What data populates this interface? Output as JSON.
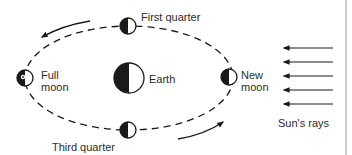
{
  "diagram": {
    "labels": {
      "first_quarter": "First quarter",
      "full_moon": "Full\nmoon",
      "earth": "Earth",
      "new_moon": "New\nmoon",
      "third_quarter": "Third quarter",
      "sun_rays": "Sun's rays"
    },
    "moons": [
      {
        "name": "first-quarter",
        "icon": "half-moon-dark-left"
      },
      {
        "name": "full-moon",
        "icon": "full-moon-face"
      },
      {
        "name": "new-moon",
        "icon": "half-moon-dark-left"
      },
      {
        "name": "third-quarter",
        "icon": "half-moon-dark-left"
      }
    ],
    "earth_icon": "half-shaded-circle",
    "orbit": {
      "style": "dashed-ellipse",
      "direction": "counter-clockwise"
    },
    "sun_ray_count": 5,
    "colors": {
      "ink": "#1a1a1a",
      "background": "#ffffff"
    }
  }
}
